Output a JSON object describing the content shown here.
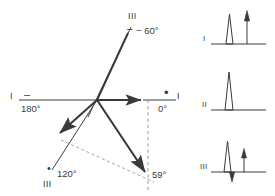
{
  "figure": {
    "type": "phasor-vector-diagram-with-spectra",
    "stroke_color": "#3a3a3a",
    "background": "#ffffff",
    "origin": {
      "x": 97,
      "y": 100
    },
    "axis": {
      "left_label": "I",
      "left_angle": "180°",
      "left_marker": "minus",
      "right_label": "I",
      "right_angle": "0°",
      "right_marker": "dot"
    },
    "vectors": [
      {
        "name": "vector-60",
        "label": "III",
        "angle_label": "− 60°",
        "marker": "minus",
        "direction": "up-right",
        "tip": {
          "x": 131,
          "y": 27
        }
      },
      {
        "name": "vector-0",
        "label": "I",
        "angle_label": "0°",
        "marker": "dot",
        "direction": "right",
        "tip": {
          "x": 143,
          "y": 100
        }
      },
      {
        "name": "vector-120",
        "label": "III",
        "angle_label": "120°",
        "marker": "dot",
        "direction": "down-left",
        "tip": {
          "x": 58,
          "y": 136
        }
      },
      {
        "name": "vector-59",
        "label": "",
        "angle_label": "59°",
        "marker": "none",
        "direction": "down-right",
        "tip": {
          "x": 147,
          "y": 176
        }
      }
    ],
    "dashed_lines": [
      {
        "name": "vertical-reference-dashed",
        "x1": 148,
        "y1": 100,
        "x2": 148,
        "y2": 191
      },
      {
        "name": "chord-dashed",
        "x1": 62,
        "y1": 141,
        "x2": 152,
        "y2": 181
      }
    ]
  },
  "panels": [
    {
      "label": "I",
      "name": "spectrum-panel-1",
      "peaks": [
        {
          "x": 30,
          "height": 30,
          "width": 7,
          "type": "triangle",
          "dir": "up"
        },
        {
          "x": 49,
          "height": 33,
          "width": 4,
          "type": "arrow",
          "dir": "up"
        }
      ],
      "negative_peaks": []
    },
    {
      "label": "II",
      "name": "spectrum-panel-2",
      "peaks": [
        {
          "x": 30,
          "height": 37,
          "width": 7,
          "type": "triangle",
          "dir": "up"
        }
      ],
      "negative_peaks": []
    },
    {
      "label": "III",
      "name": "spectrum-panel-3",
      "peaks": [
        {
          "x": 28,
          "height": 31,
          "width": 7,
          "type": "triangle",
          "dir": "up"
        },
        {
          "x": 46,
          "height": 23,
          "width": 4,
          "type": "arrow",
          "dir": "up"
        }
      ],
      "negative_peaks": [
        {
          "x": 34,
          "height": 10,
          "width": 5,
          "type": "triangle",
          "dir": "down"
        }
      ]
    }
  ]
}
